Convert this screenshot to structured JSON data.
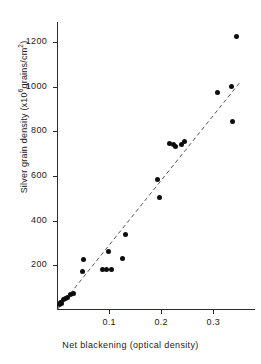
{
  "chart_data": {
    "type": "scatter",
    "title": "",
    "xlabel": "Net blackening (optical density)",
    "ylabel_text": "Silver grain density (x10",
    "ylabel_sup": "6",
    "ylabel_tail": "grains/cm",
    "ylabel_sup2": "2",
    "ylabel_close": ")",
    "ylabel_full": "Silver grain density (x10⁶ grains/cm²)",
    "xlim": [
      0,
      0.38
    ],
    "ylim": [
      0,
      1290
    ],
    "grid": false,
    "legend": "none",
    "xticks": [
      0.1,
      0.2,
      0.3
    ],
    "xtick_labels": [
      "0.1",
      "0.2",
      "0.3"
    ],
    "yticks": [
      200,
      400,
      600,
      800,
      1000,
      1200
    ],
    "ytick_labels": [
      "200",
      "400",
      "600",
      "800",
      "1000",
      "1200"
    ],
    "marker": "filled-circle",
    "marker_color": "#0d0d0d",
    "points": [
      {
        "x": 0.004,
        "y": 25
      },
      {
        "x": 0.006,
        "y": 35
      },
      {
        "x": 0.009,
        "y": 30
      },
      {
        "x": 0.012,
        "y": 48
      },
      {
        "x": 0.016,
        "y": 52
      },
      {
        "x": 0.021,
        "y": 55
      },
      {
        "x": 0.026,
        "y": 68
      },
      {
        "x": 0.031,
        "y": 72
      },
      {
        "x": 0.049,
        "y": 172
      },
      {
        "x": 0.051,
        "y": 228
      },
      {
        "x": 0.088,
        "y": 183
      },
      {
        "x": 0.094,
        "y": 183
      },
      {
        "x": 0.099,
        "y": 263
      },
      {
        "x": 0.104,
        "y": 181
      },
      {
        "x": 0.125,
        "y": 233
      },
      {
        "x": 0.132,
        "y": 340
      },
      {
        "x": 0.193,
        "y": 585
      },
      {
        "x": 0.197,
        "y": 503
      },
      {
        "x": 0.216,
        "y": 745
      },
      {
        "x": 0.223,
        "y": 742
      },
      {
        "x": 0.227,
        "y": 733
      },
      {
        "x": 0.238,
        "y": 742
      },
      {
        "x": 0.244,
        "y": 753
      },
      {
        "x": 0.308,
        "y": 973
      },
      {
        "x": 0.334,
        "y": 1000
      },
      {
        "x": 0.336,
        "y": 845
      },
      {
        "x": 0.345,
        "y": 1225
      }
    ],
    "fit_line": {
      "style": "dashed",
      "color": "#555555",
      "x_start": 0.0,
      "y_start": 0,
      "x_end": 0.352,
      "y_end": 1022
    }
  },
  "axes": {
    "y_axis_name": "silver-grain-density-axis",
    "x_axis_name": "net-blackening-axis"
  }
}
